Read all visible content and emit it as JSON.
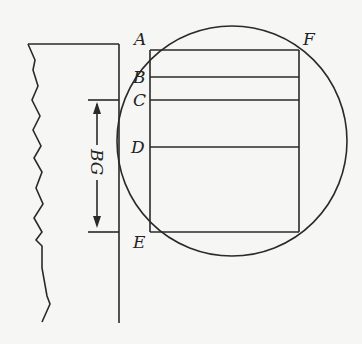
{
  "diagram": {
    "type": "geometry-figure",
    "labels": {
      "A": "A",
      "B": "B",
      "C": "C",
      "D": "D",
      "E": "E",
      "F": "F",
      "dimension": "BG"
    },
    "colors": {
      "background": "#f6f6f4",
      "stroke": "#2a2a2a"
    }
  }
}
